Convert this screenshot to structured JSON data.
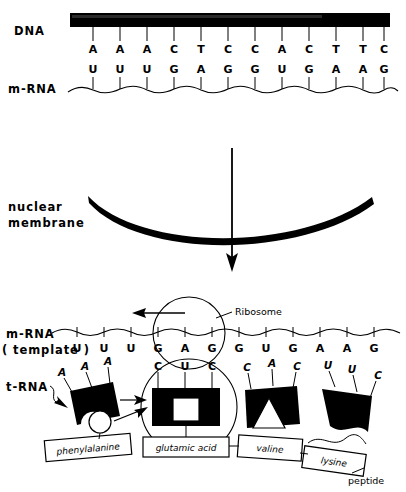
{
  "figure": {
    "colors": {
      "ink": "#000000",
      "background": "#ffffff"
    }
  },
  "transcription": {
    "dna_label": "DNA",
    "mrna_label": "m-RNA",
    "dna_bases": [
      "A",
      "A",
      "A",
      "C",
      "T",
      "C",
      "C",
      "A",
      "C",
      "T",
      "T",
      "C"
    ],
    "mrna_bases": [
      "U",
      "U",
      "U",
      "G",
      "A",
      "G",
      "G",
      "U",
      "G",
      "A",
      "A",
      "G"
    ],
    "dna_codons": [
      "AAA",
      "CTC",
      "CAC",
      "TTC"
    ],
    "mrna_codons": [
      "UUU",
      "GAG",
      "GUG",
      "AAG"
    ]
  },
  "nucleus": {
    "membrane_label_line1": "nuclear",
    "membrane_label_line2": "membrane",
    "arrow_name": "downward-transport-arrow"
  },
  "translation": {
    "mrna_label_line1": "m-RNA",
    "mrna_label_line2": "( template )",
    "trna_label": "t-RNA",
    "ribosome_label": "Ribosome",
    "peptide_label": "peptide",
    "mrna_bases": [
      "U",
      "U",
      "U",
      "G",
      "A",
      "G",
      "G",
      "U",
      "G",
      "A",
      "A",
      "G"
    ],
    "trnas": [
      {
        "anticodon": [
          "A",
          "A",
          "A"
        ],
        "amino_acid": "phenylalanine",
        "shape": "notched-block",
        "released": true
      },
      {
        "anticodon": [
          "C",
          "U",
          "C"
        ],
        "amino_acid": "glutamic acid",
        "shape": "square-carrier",
        "released": false
      },
      {
        "anticodon": [
          "C",
          "A",
          "C"
        ],
        "amino_acid": "valine",
        "shape": "triangle-carrier",
        "released": false
      },
      {
        "anticodon": [
          "U",
          "U",
          "C"
        ],
        "amino_acid": "lysine",
        "shape": "wave-block",
        "released": false
      }
    ]
  }
}
